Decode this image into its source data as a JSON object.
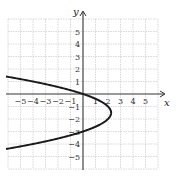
{
  "chart_data": {
    "type": "line",
    "title": "",
    "xlabel": "x",
    "ylabel": "y",
    "xlim": [
      -6,
      6
    ],
    "ylim": [
      -6,
      6
    ],
    "grid": true,
    "x_ticks": [
      "-5",
      "-4",
      "-3",
      "-2",
      "-1",
      "1",
      "2",
      "3",
      "4",
      "5"
    ],
    "y_ticks": [
      "5",
      "4",
      "3",
      "2",
      "1",
      "-1",
      "-2",
      "-3",
      "-4",
      "-5"
    ],
    "series": [
      {
        "name": "parabola opening left",
        "equation": "x = -(y + 1.5)^2 + 2.25",
        "vertex": [
          2.25,
          -1.5
        ],
        "points": [
          {
            "x": -6.6,
            "y": 1.35
          },
          {
            "x": -4.0,
            "y": 1.0
          },
          {
            "x": 0,
            "y": 0
          },
          {
            "x": 2.0,
            "y": -1.0
          },
          {
            "x": 2.25,
            "y": -1.5
          },
          {
            "x": 2.0,
            "y": -2.0
          },
          {
            "x": 0,
            "y": -3
          },
          {
            "x": -4.0,
            "y": -4.0
          },
          {
            "x": -6.6,
            "y": -4.35
          }
        ]
      }
    ]
  },
  "axes": {
    "x_label": "x",
    "y_label": "y"
  }
}
